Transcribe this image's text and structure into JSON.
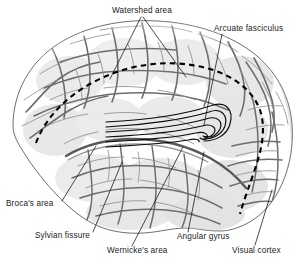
{
  "figure": {
    "background_color": "#ffffff",
    "ink_color": "#111111",
    "brain_fill_color": "#cfcfcf",
    "sulci_color": "#6e6e6e"
  },
  "labels": {
    "watershed_area": "Watershed area",
    "arcuate_fasciculus": "Arcuate fasciculus",
    "brocas_area": "Broca's area",
    "sylvian_fissure": "Sylvian fissure",
    "wernickes_area": "Wernicke's area",
    "angular_gyrus": "Angular gyrus",
    "visual_cortex": "Visual cortex"
  },
  "annotations": {
    "watershed_line_style": "dashed",
    "arcuate_fasciculus_style": "bundle of 6 parallel curved fibers",
    "leader_line_count": 8
  }
}
